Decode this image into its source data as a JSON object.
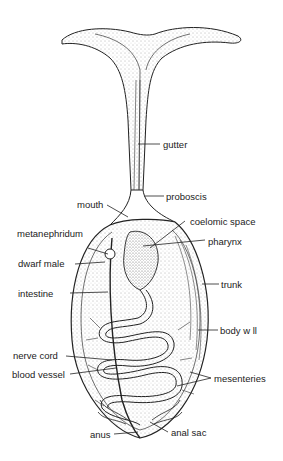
{
  "diagram": {
    "type": "anatomical illustration",
    "labels": {
      "gutter": "gutter",
      "proboscis": "proboscis",
      "mouth": "mouth",
      "coelomic_space": "coelomic space",
      "metanephridum": "metanephridum",
      "pharynx": "pharynx",
      "dwarf_male": "dwarf male",
      "trunk": "trunk",
      "intestine": "intestine",
      "body_wall": "body w ll",
      "nerve_cord": "nerve cord",
      "blood_vessel": "blood vessel",
      "mesenteries": "mesenteries",
      "anus": "anus",
      "anal_sac": "anal sac"
    }
  }
}
